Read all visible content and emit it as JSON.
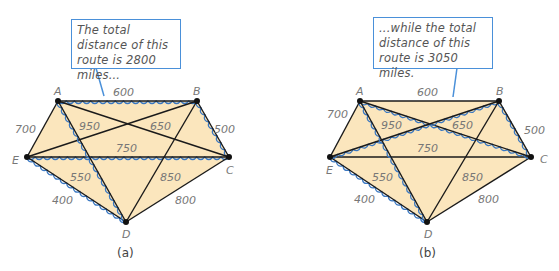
{
  "colors": {
    "fill": "#fbe6bd",
    "edge": "#1a1a1a",
    "route": "#3a78c2",
    "callout_border": "#4a90d9"
  },
  "panels": [
    {
      "caption": "(a)",
      "callout": "The total distance of this route is 2800 miles...",
      "vertices": {
        "A": [
          58,
          101
        ],
        "B": [
          197,
          101
        ],
        "C": [
          229,
          157
        ],
        "D": [
          126,
          222
        ],
        "E": [
          27,
          157
        ]
      },
      "edges": [
        {
          "from": "A",
          "to": "B",
          "weight": "600",
          "route": true
        },
        {
          "from": "B",
          "to": "C",
          "weight": "500",
          "route": true
        },
        {
          "from": "A",
          "to": "E",
          "weight": "700",
          "route": false
        },
        {
          "from": "E",
          "to": "C",
          "weight": "750",
          "route": true
        },
        {
          "from": "E",
          "to": "D",
          "weight": "400",
          "route": true
        },
        {
          "from": "D",
          "to": "C",
          "weight": "800",
          "route": false
        },
        {
          "from": "A",
          "to": "C",
          "weight": "950",
          "route": false
        },
        {
          "from": "E",
          "to": "B",
          "weight": "650",
          "route": false
        },
        {
          "from": "A",
          "to": "D",
          "weight": "550",
          "route": true
        },
        {
          "from": "B",
          "to": "D",
          "weight": "850",
          "route": false
        }
      ],
      "total_miles": 2800
    },
    {
      "caption": "(b)",
      "callout": "...while the total distance of this route is 3050 miles.",
      "vertices": {
        "A": [
          360,
          101
        ],
        "B": [
          499,
          101
        ],
        "C": [
          531,
          157
        ],
        "D": [
          427,
          222
        ],
        "E": [
          330,
          157
        ]
      },
      "edges": [
        {
          "from": "A",
          "to": "B",
          "weight": "600",
          "route": false
        },
        {
          "from": "B",
          "to": "C",
          "weight": "500",
          "route": true
        },
        {
          "from": "A",
          "to": "E",
          "weight": "700",
          "route": false
        },
        {
          "from": "E",
          "to": "C",
          "weight": "750",
          "route": false
        },
        {
          "from": "E",
          "to": "D",
          "weight": "400",
          "route": true
        },
        {
          "from": "D",
          "to": "C",
          "weight": "800",
          "route": false
        },
        {
          "from": "A",
          "to": "C",
          "weight": "950",
          "route": true
        },
        {
          "from": "E",
          "to": "B",
          "weight": "650",
          "route": true
        },
        {
          "from": "A",
          "to": "D",
          "weight": "550",
          "route": true
        },
        {
          "from": "B",
          "to": "D",
          "weight": "850",
          "route": false
        }
      ],
      "total_miles": 3050
    }
  ]
}
